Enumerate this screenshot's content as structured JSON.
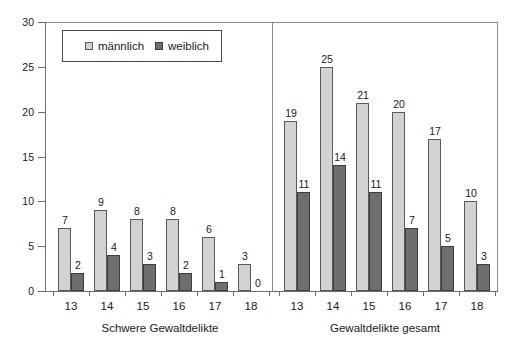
{
  "chart_data": {
    "type": "bar",
    "title": "",
    "xlabel": "",
    "ylabel": "",
    "ylim": [
      0,
      30
    ],
    "y_ticks": [
      0,
      5,
      10,
      15,
      20,
      25,
      30
    ],
    "grid": false,
    "legend_position": "top-left",
    "legend": [
      "männlich",
      "weiblich"
    ],
    "panels": [
      {
        "caption": "Schwere Gewaltdelikte",
        "categories": [
          "13",
          "14",
          "15",
          "16",
          "17",
          "18"
        ],
        "series": [
          {
            "name": "männlich",
            "values": [
              7,
              9,
              8,
              8,
              6,
              3
            ]
          },
          {
            "name": "weiblich",
            "values": [
              2,
              4,
              3,
              2,
              1,
              0
            ]
          }
        ]
      },
      {
        "caption": "Gewaltdelikte gesamt",
        "categories": [
          "13",
          "14",
          "15",
          "16",
          "17",
          "18"
        ],
        "series": [
          {
            "name": "männlich",
            "values": [
              19,
              25,
              21,
              20,
              17,
              10
            ]
          },
          {
            "name": "weiblich",
            "values": [
              11,
              14,
              11,
              7,
              5,
              3
            ]
          }
        ]
      }
    ],
    "colors": {
      "maennlich": "#d2d2d2",
      "weiblich": "#6e6e6e",
      "axis": "#6d6d6d",
      "frame": "#8a8a8a",
      "background": "#ffffff",
      "text": "#1a1a1a"
    }
  }
}
